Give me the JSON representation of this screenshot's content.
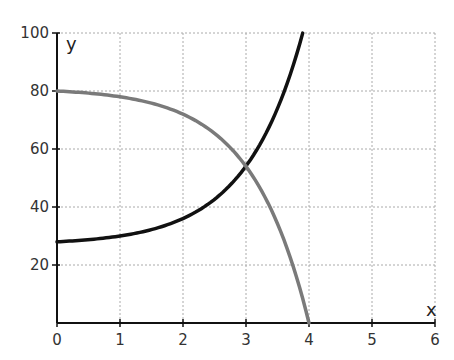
{
  "chart_data": {
    "type": "line",
    "title": "",
    "xlabel": "x",
    "ylabel": "y",
    "xlim": [
      0,
      6
    ],
    "ylim": [
      0,
      100
    ],
    "xticks": [
      0,
      1,
      2,
      3,
      4,
      5,
      6
    ],
    "yticks": [
      20,
      40,
      60,
      80,
      100
    ],
    "x_tick_labels": [
      "0",
      "1",
      "2",
      "3",
      "4",
      "5",
      "6"
    ],
    "y_tick_labels": [
      "20",
      "40",
      "60",
      "80",
      "100"
    ],
    "grid": true,
    "legend": null,
    "series": [
      {
        "name": "increasing curve",
        "color": "#111111",
        "x": [
          0,
          0.5,
          1,
          1.5,
          2,
          2.5,
          3,
          3.5,
          3.9
        ],
        "y": [
          28,
          28.7,
          30,
          32.2,
          36,
          42.6,
          54.1,
          74.1,
          100
        ]
      },
      {
        "name": "decreasing curve",
        "color": "#7a7a7a",
        "x": [
          0,
          0.5,
          1,
          1.5,
          2,
          2.5,
          3,
          3.5,
          4
        ],
        "y": [
          80,
          79.3,
          78,
          75.8,
          72,
          65.4,
          54,
          34.2,
          0
        ]
      }
    ],
    "annotations": [
      "curves intersect near (3, 54)"
    ]
  }
}
